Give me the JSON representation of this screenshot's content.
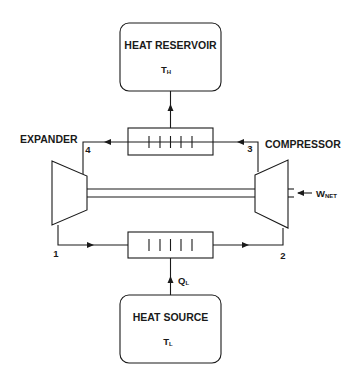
{
  "diagram": {
    "type": "reversed Brayton / heat pump cycle schematic",
    "heat_reservoir": {
      "title": "HEAT RESERVOIR",
      "temp_symbol": "T",
      "temp_subscript": "H"
    },
    "heat_source": {
      "title": "HEAT SOURCE",
      "temp_symbol": "T",
      "temp_subscript": "L"
    },
    "components": {
      "expander_label": "EXPANDER",
      "compressor_label": "COMPRESSOR"
    },
    "state_points": {
      "p1": "1",
      "p2": "2",
      "p3": "3",
      "p4": "4"
    },
    "work": {
      "symbol": "W",
      "subscript": "NET"
    },
    "heat_in": {
      "symbol": "Q",
      "subscript": "L"
    },
    "heat_exchanger_fins": 5,
    "colors": {
      "line": "#1a1a1a",
      "background": "#ffffff"
    }
  }
}
